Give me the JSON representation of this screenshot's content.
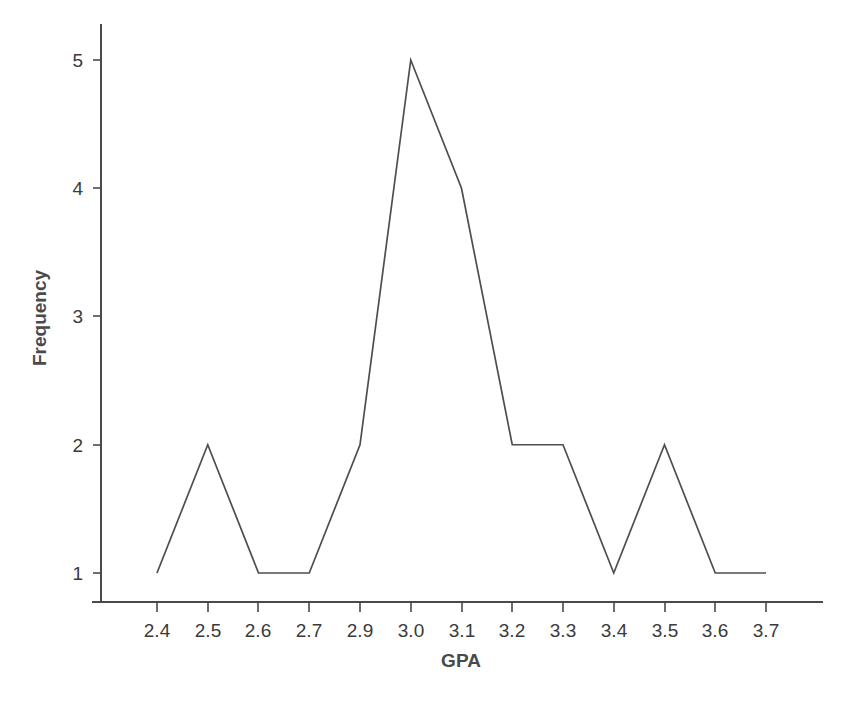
{
  "chart_data": {
    "type": "line",
    "title": "",
    "subtitle": "",
    "xlabel": "GPA",
    "ylabel": "Frequency",
    "categories": [
      "2.4",
      "2.5",
      "2.6",
      "2.7",
      "2.9",
      "3.0",
      "3.1",
      "3.2",
      "3.3",
      "3.4",
      "3.5",
      "3.6",
      "3.7"
    ],
    "x": [
      2.4,
      2.5,
      2.6,
      2.7,
      2.9,
      3.0,
      3.1,
      3.2,
      3.3,
      3.4,
      3.5,
      3.6,
      3.7
    ],
    "values": [
      1,
      2,
      1,
      1,
      2,
      5,
      4,
      2,
      2,
      1,
      2,
      1,
      1
    ],
    "series": [
      {
        "name": "Frequency",
        "values": [
          1,
          2,
          1,
          1,
          2,
          5,
          4,
          2,
          2,
          1,
          2,
          1,
          1
        ]
      }
    ],
    "ylim": [
      0,
      5.4
    ],
    "yticks": [
      1,
      2,
      3,
      4,
      5
    ],
    "ytick_labels": [
      "1",
      "2",
      "3",
      "4",
      "5"
    ],
    "xtick_labels": [
      "2.4",
      "2.5",
      "2.6",
      "2.7",
      "2.9",
      "3.0",
      "3.1",
      "3.2",
      "3.3",
      "3.4",
      "3.5",
      "3.6",
      "3.7"
    ],
    "grid": false,
    "legend": false,
    "legend_position": "none",
    "note": "X axis omits the 2.8 category; categories are evenly spaced.",
    "colors": {
      "background": "#ffffff",
      "line": "#4e4e4e",
      "axis": "#4a4a4a",
      "tick_label": "#3a3a3a",
      "axis_title": "#4a4a4a"
    }
  },
  "axis": {
    "y_title": "Frequency",
    "x_title": "GPA",
    "y_ticks": [
      {
        "label": "5"
      },
      {
        "label": "4"
      },
      {
        "label": "3"
      },
      {
        "label": "2"
      },
      {
        "label": "1"
      }
    ],
    "x_ticks": [
      {
        "label": "2.4"
      },
      {
        "label": "2.5"
      },
      {
        "label": "2.6"
      },
      {
        "label": "2.7"
      },
      {
        "label": "2.9"
      },
      {
        "label": "3.0"
      },
      {
        "label": "3.1"
      },
      {
        "label": "3.2"
      },
      {
        "label": "3.3"
      },
      {
        "label": "3.4"
      },
      {
        "label": "3.5"
      },
      {
        "label": "3.6"
      },
      {
        "label": "3.7"
      }
    ]
  }
}
